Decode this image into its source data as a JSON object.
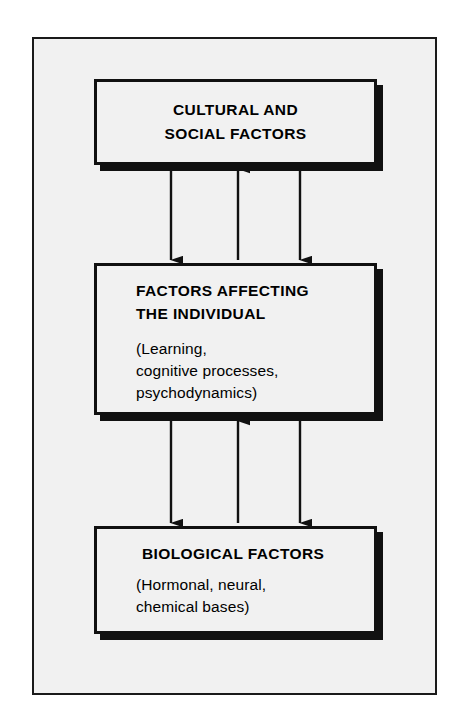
{
  "figure": {
    "background_color": "#f1f1f1",
    "border_color": "#1a1a1a",
    "ink_color": "#111111"
  },
  "diagram": {
    "type": "block-flow",
    "orientation": "vertical",
    "levels": [
      {
        "id": "cultural-social",
        "title": "CULTURAL AND\nSOCIAL FACTORS",
        "subtitle": ""
      },
      {
        "id": "individual",
        "title": "FACTORS AFFECTING\nTHE INDIVIDUAL",
        "subtitle": "(Learning,\ncognitive processes,\npsychodynamics)"
      },
      {
        "id": "biological",
        "title": "BIOLOGICAL FACTORS",
        "subtitle": "(Hormonal, neural,\nchemical bases)"
      }
    ],
    "connectors": [
      {
        "id": "top-to-middle",
        "arrows": [
          {
            "position": "left",
            "direction": "down"
          },
          {
            "position": "center",
            "direction": "up"
          },
          {
            "position": "right",
            "direction": "down"
          }
        ]
      },
      {
        "id": "middle-to-bottom",
        "arrows": [
          {
            "position": "left",
            "direction": "down"
          },
          {
            "position": "center",
            "direction": "up"
          },
          {
            "position": "right",
            "direction": "down"
          }
        ]
      }
    ]
  }
}
